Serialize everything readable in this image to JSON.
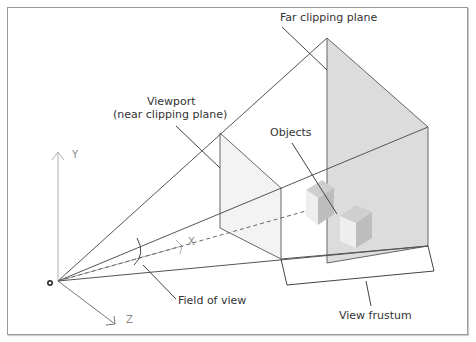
{
  "diagram": {
    "labels": {
      "far_plane": "Far clipping plane",
      "viewport_line1": "Viewport",
      "viewport_line2": "(near clipping plane)",
      "objects": "Objects",
      "field_of_view": "Field of view",
      "view_frustum": "View frustum"
    },
    "axes": {
      "x": "X",
      "y": "Y",
      "z": "Z"
    },
    "colors": {
      "line": "#555555",
      "axis": "#aaaaaa",
      "far_plane_fill": "#d9d9d9",
      "near_plane_fill": "#f2f2f2",
      "frame": "#9a9a9a"
    }
  }
}
